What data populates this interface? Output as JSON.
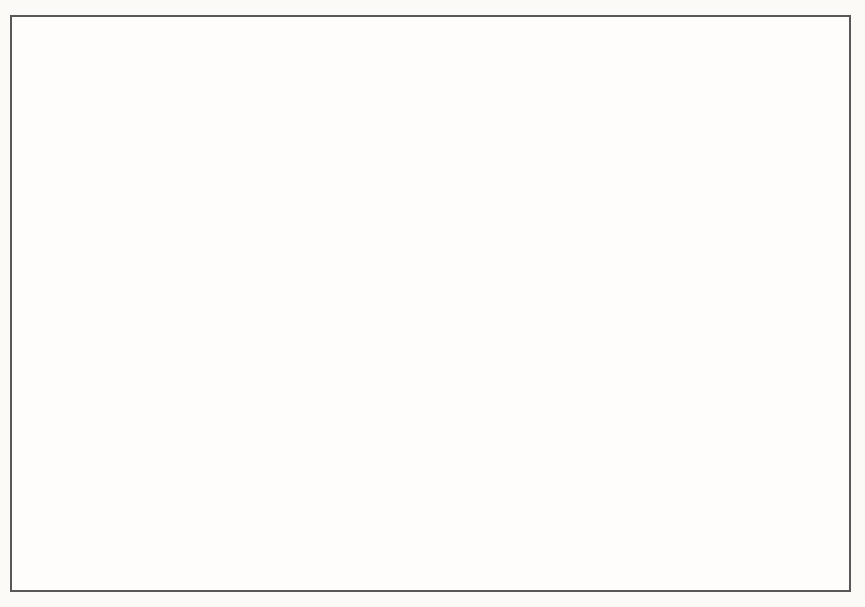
{
  "colors": {
    "paper": "#fbfaf7",
    "frame_border": "#585858",
    "axis_ink": "#1c1c1c",
    "text_ink": "#2c2926",
    "potential_dash": "#3a3a3a",
    "guide_dash": "#4a4a4a",
    "band_light": "#cbcbcb",
    "band_dark": "#000000"
  },
  "chart_data": {
    "type": "line",
    "title": "",
    "xlabel": "",
    "ylabel": "Real GDP",
    "categories": [
      "19X1",
      "19X2",
      "19X3",
      "19X4",
      "19X5",
      "19X6",
      "19X7"
    ],
    "y_axis_numeric": false,
    "grid": false,
    "legend_position": "labels at right end of each curve",
    "series": [
      {
        "name": "Aggregate Demand",
        "label_lines": [
          "Aggregate",
          "Demand"
        ],
        "style": "thick band, gradient light gray to black, accelerating upward curve",
        "relative_values": [
          51,
          61,
          72,
          85,
          102,
          125,
          160
        ]
      },
      {
        "name": "Potential Output",
        "label_lines": [
          "Potential",
          "Output"
        ],
        "style": "thick dashed line, nearly flat with slight upward slope",
        "relative_values": [
          96,
          97.5,
          99,
          100.5,
          102,
          103.5,
          105
        ]
      }
    ],
    "crossing_note": "Aggregate Demand crosses Potential Output between 19X4 and 19X5, marked by a vertical dashed guide line",
    "annotations": {
      "inflation": [
        "When aggregate demand",
        "rises faster than output",
        "can rise, the result",
        "is inflation."
      ],
      "rising": [
        "Rising aggregate demand",
        "increases output and",
        "employment, up to the level",
        "of potential output."
      ]
    },
    "geometry": {
      "axis": {
        "origin": [
          100,
          514
        ],
        "y_top": 80,
        "x_end": 778,
        "tick_xs": [
          185,
          275,
          366,
          457,
          547,
          638,
          728
        ],
        "tick_len": 17,
        "label_xs": [
          140,
          231,
          322,
          413,
          503,
          594,
          688
        ]
      },
      "guide": {
        "x": 457,
        "y1": 179,
        "y2": 514,
        "dash": "8 7.5",
        "width": 1.6
      },
      "potential": {
        "x1": 104,
        "y1": 275,
        "x2": 682,
        "y2": 248,
        "width": 9,
        "dash": "19 12"
      },
      "band": {
        "bezier": [
          [
            100,
            397
          ],
          [
            300,
            346
          ],
          [
            545,
            288
          ],
          [
            678,
            104
          ]
        ],
        "half_width": 19,
        "outline": "#1f1f1f",
        "grad": {
          "x1": 100,
          "y1": 420,
          "x2": 655,
          "y2": 95,
          "stops": [
            [
              0,
              "#cbcbcb"
            ],
            [
              0.3,
              "#a3a3a3"
            ],
            [
              0.55,
              "#6e6e6e"
            ],
            [
              0.8,
              "#1d1d1d"
            ],
            [
              1,
              "#000000"
            ]
          ]
        }
      },
      "arrows": [
        {
          "x1": 497,
          "y1": 134,
          "x2": 547,
          "y2": 179
        },
        {
          "x1": 369,
          "y1": 376,
          "x2": 352,
          "y2": 344
        }
      ],
      "scan_artifacts": [
        "M226,3 q4,4 9,2",
        "M291,4 q3,3 7,2",
        "M415,3 q3,3 7,1",
        "M630,0 q0,6 -6,7",
        "M664,5 h6",
        "M697,4 q3,3 7,2",
        "M794,0 q0,6 -6,7"
      ]
    }
  }
}
